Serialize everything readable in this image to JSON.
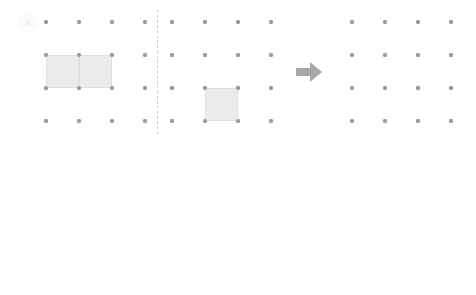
{
  "page": {
    "background_color": "#ffffff",
    "width": 476,
    "height": 295
  },
  "style": {
    "dot_color": "#9b9b9f",
    "cell_fill": "#ebebeb",
    "cell_stroke": "#dfdfdf",
    "divider_color": "#e6c9c9",
    "arrow_color": "#a8a8a8",
    "badge_text_color": "#f2f2f2",
    "badge_fill": "#fbfbfb"
  },
  "grid": {
    "spacing": 33,
    "dot_diameter": 4,
    "columns": 4,
    "rows": 4
  },
  "rows": [
    {
      "id": "row-a",
      "label": "a",
      "top": 0,
      "grid_origin_y": 22,
      "divider": {
        "x": 157,
        "y_top": 10,
        "height": 124
      },
      "arrow": {
        "x": 296,
        "y": 62,
        "label": "arrow-right"
      },
      "panels": [
        {
          "id": "panel-a-left",
          "name": "source-figure",
          "origin_x": 46,
          "shapes": [
            {
              "col": 0,
              "row": 1,
              "w": 1,
              "h": 1
            },
            {
              "col": 1,
              "row": 1,
              "w": 1,
              "h": 1
            }
          ]
        },
        {
          "id": "panel-a-middle",
          "name": "piece-figure",
          "origin_x": 172,
          "shapes": [
            {
              "col": 1,
              "row": 2,
              "w": 1,
              "h": 1
            }
          ]
        },
        {
          "id": "panel-a-right",
          "name": "answer-figure",
          "origin_x": 352,
          "shapes": []
        }
      ]
    },
    {
      "id": "row-b",
      "label": "b",
      "top": 148,
      "grid_origin_y": 170,
      "divider": {
        "x": 157,
        "y_top": 158,
        "height": 124
      },
      "arrow": {
        "x": 296,
        "y": 210,
        "label": "arrow-right"
      },
      "panels": [
        {
          "id": "panel-b-left",
          "name": "source-figure",
          "origin_x": 46,
          "shapes": [
            {
              "col": 1,
              "row": 1,
              "w": 1,
              "h": 1
            },
            {
              "col": 2,
              "row": 1,
              "w": 1,
              "h": 1
            },
            {
              "col": 2,
              "row": 2,
              "w": 1,
              "h": 1
            }
          ]
        },
        {
          "id": "panel-b-middle",
          "name": "piece-figure",
          "origin_x": 172,
          "shapes": [
            {
              "col": 0,
              "row": 0,
              "w": 1,
              "h": 1
            },
            {
              "col": 0,
              "row": 1,
              "w": 1,
              "h": 1
            }
          ]
        },
        {
          "id": "panel-b-right",
          "name": "answer-figure",
          "origin_x": 352,
          "shapes": []
        }
      ]
    }
  ]
}
